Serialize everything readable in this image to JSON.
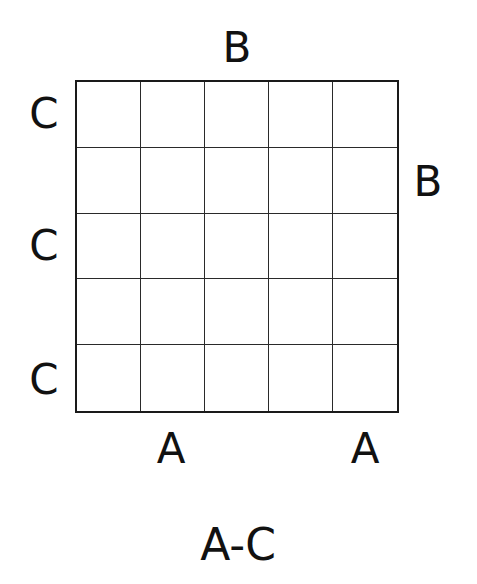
{
  "puzzle": {
    "grid": {
      "rows": 5,
      "cols": 5,
      "cells": [
        [
          "",
          "",
          "",
          "",
          ""
        ],
        [
          "",
          "",
          "",
          "",
          ""
        ],
        [
          "",
          "",
          "",
          "",
          ""
        ],
        [
          "",
          "",
          "",
          "",
          ""
        ],
        [
          "",
          "",
          "",
          "",
          ""
        ]
      ]
    },
    "clues": {
      "top": [
        "",
        "",
        "B",
        "",
        ""
      ],
      "bottom": [
        "",
        "A",
        "",
        "",
        "A"
      ],
      "left": [
        "C",
        "",
        "C",
        "",
        "C"
      ],
      "right": [
        "",
        "B",
        "",
        "",
        ""
      ]
    },
    "letter_range": "A-C"
  }
}
